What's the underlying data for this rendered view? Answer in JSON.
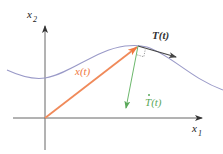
{
  "diagram": {
    "type": "vector-geometry",
    "axes": {
      "x1": {
        "label_main": "x",
        "label_sub": "1"
      },
      "x2": {
        "label_main": "x",
        "label_sub": "2"
      }
    },
    "labels": {
      "position_vector": "x(t)",
      "tangent_vector": "T(t)",
      "tangent_derivative_main": "T",
      "tangent_derivative_suffix": "(t)"
    },
    "colors": {
      "axes": "#555555",
      "curve": "#9a9ac8",
      "position_vector": "#f08a5a",
      "tangent_vector": "#444444",
      "tangent_derivative": "#6cb86c",
      "right_angle_marker": "#888888",
      "label_position": "#f07840",
      "label_tangent": "#333333",
      "label_derivative": "#5aa85a"
    }
  }
}
